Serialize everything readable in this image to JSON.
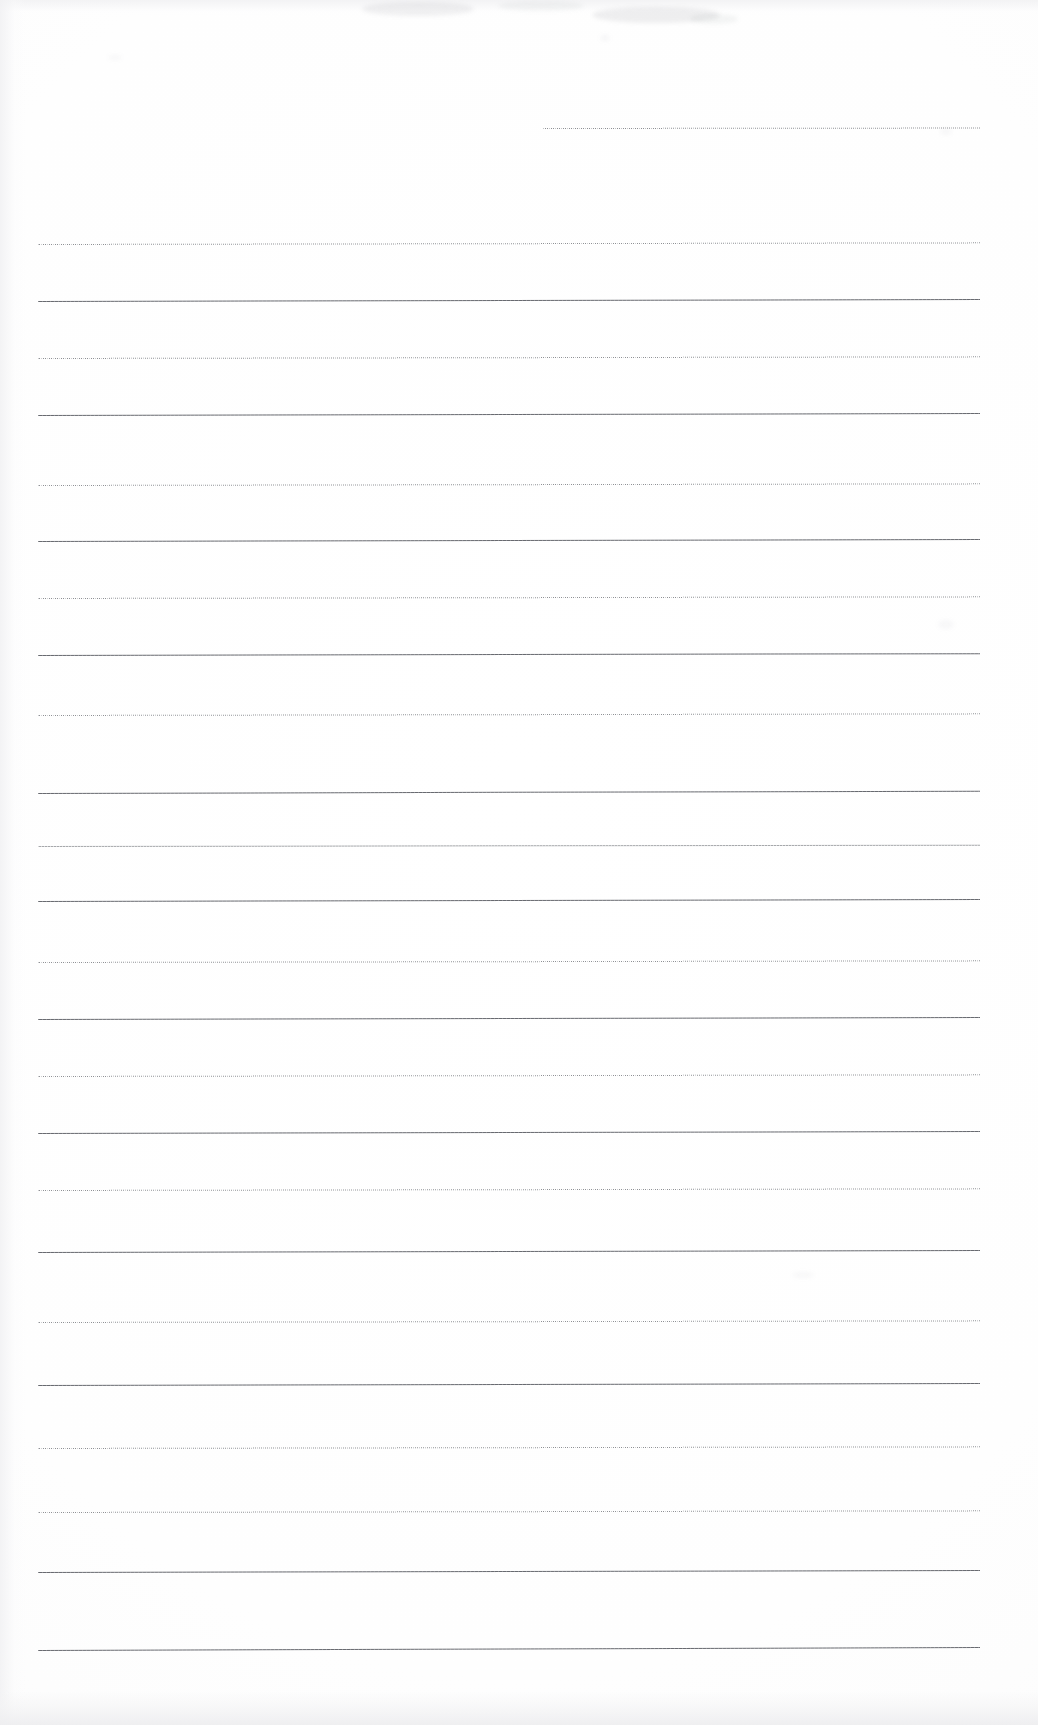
{
  "document": {
    "kind": "scanned-ruled-paper",
    "title": "Blank ruled notebook page (scan)",
    "written_content": "",
    "page_width": 1038,
    "page_height": 1725,
    "paper_color": "#ffffff",
    "rule_color": "#5a5c62",
    "rule_left_margin": 38,
    "rule_right_margin": 980,
    "rule_count_full_width": 25,
    "rule_count_partial": 1,
    "text_blocks": [],
    "annotations": []
  },
  "rules": [
    {
      "name": "rule-partial-header",
      "x": 543,
      "y": 128,
      "width": 437,
      "tilt": -0.06,
      "weight": "soft",
      "partial": true
    },
    {
      "name": "rule-1",
      "x": 38,
      "y": 244,
      "width": 942,
      "tilt": -0.1,
      "weight": "soft"
    },
    {
      "name": "rule-2",
      "x": 38,
      "y": 301,
      "width": 942,
      "tilt": -0.12,
      "weight": "dense"
    },
    {
      "name": "rule-3",
      "x": 38,
      "y": 358,
      "width": 942,
      "tilt": -0.1,
      "weight": "soft"
    },
    {
      "name": "rule-4",
      "x": 38,
      "y": 415,
      "width": 942,
      "tilt": -0.12,
      "weight": "dense"
    },
    {
      "name": "rule-5",
      "x": 38,
      "y": 485,
      "width": 942,
      "tilt": -0.1,
      "weight": "soft"
    },
    {
      "name": "rule-6",
      "x": 38,
      "y": 541,
      "width": 942,
      "tilt": -0.12,
      "weight": "dense"
    },
    {
      "name": "rule-7",
      "x": 38,
      "y": 598,
      "width": 942,
      "tilt": -0.1,
      "weight": "soft"
    },
    {
      "name": "rule-8",
      "x": 38,
      "y": 655,
      "width": 942,
      "tilt": -0.11,
      "weight": "dense"
    },
    {
      "name": "rule-9",
      "x": 38,
      "y": 715,
      "width": 942,
      "tilt": -0.1,
      "weight": "soft"
    },
    {
      "name": "rule-10",
      "x": 38,
      "y": 793,
      "width": 942,
      "tilt": -0.14,
      "weight": "dense"
    },
    {
      "name": "rule-11",
      "x": 38,
      "y": 846,
      "width": 942,
      "tilt": -0.08,
      "weight": "light"
    },
    {
      "name": "rule-12",
      "x": 38,
      "y": 901,
      "width": 942,
      "tilt": -0.12,
      "weight": "dense"
    },
    {
      "name": "rule-13",
      "x": 38,
      "y": 962,
      "width": 942,
      "tilt": -0.1,
      "weight": "soft"
    },
    {
      "name": "rule-14",
      "x": 38,
      "y": 1019,
      "width": 942,
      "tilt": -0.12,
      "weight": "dense"
    },
    {
      "name": "rule-15",
      "x": 38,
      "y": 1076,
      "width": 942,
      "tilt": -0.1,
      "weight": "soft"
    },
    {
      "name": "rule-16",
      "x": 38,
      "y": 1133,
      "width": 942,
      "tilt": -0.12,
      "weight": "dense"
    },
    {
      "name": "rule-17",
      "x": 38,
      "y": 1190,
      "width": 942,
      "tilt": -0.1,
      "weight": "soft"
    },
    {
      "name": "rule-18",
      "x": 38,
      "y": 1252,
      "width": 942,
      "tilt": -0.12,
      "weight": "dense"
    },
    {
      "name": "rule-19",
      "x": 38,
      "y": 1322,
      "width": 942,
      "tilt": -0.1,
      "weight": "soft"
    },
    {
      "name": "rule-20",
      "x": 38,
      "y": 1385,
      "width": 942,
      "tilt": -0.12,
      "weight": "dense"
    },
    {
      "name": "rule-21",
      "x": 38,
      "y": 1448,
      "width": 942,
      "tilt": -0.1,
      "weight": "soft"
    },
    {
      "name": "rule-22",
      "x": 38,
      "y": 1512,
      "width": 942,
      "tilt": -0.1,
      "weight": "soft"
    },
    {
      "name": "rule-23",
      "x": 38,
      "y": 1572,
      "width": 942,
      "tilt": -0.12,
      "weight": "dense"
    },
    {
      "name": "rule-24",
      "x": 38,
      "y": 1650,
      "width": 942,
      "tilt": -0.18,
      "weight": "dense"
    }
  ],
  "artifacts": [
    {
      "name": "scan-smudge-top-left",
      "x": 362,
      "y": 2,
      "width": 112,
      "height": 14,
      "opacity": 0.1
    },
    {
      "name": "scan-smudge-top-center",
      "x": 498,
      "y": 1,
      "width": 86,
      "height": 10,
      "opacity": 0.07
    },
    {
      "name": "scan-smudge-top-right",
      "x": 592,
      "y": 7,
      "width": 128,
      "height": 16,
      "opacity": 0.12
    },
    {
      "name": "scan-smudge-top-far",
      "x": 690,
      "y": 14,
      "width": 48,
      "height": 10,
      "opacity": 0.08
    },
    {
      "name": "scan-speck-upper",
      "x": 600,
      "y": 35,
      "width": 10,
      "height": 6,
      "opacity": 0.06
    },
    {
      "name": "scan-speck-left",
      "x": 108,
      "y": 55,
      "width": 14,
      "height": 5,
      "opacity": 0.05
    },
    {
      "name": "scan-speck-right",
      "x": 940,
      "y": 128,
      "width": 12,
      "height": 7,
      "opacity": 0.05
    },
    {
      "name": "scan-speck-mid-right",
      "x": 938,
      "y": 620,
      "width": 16,
      "height": 9,
      "opacity": 0.05
    },
    {
      "name": "scan-speck-low-right",
      "x": 792,
      "y": 1272,
      "width": 22,
      "height": 6,
      "opacity": 0.05
    }
  ]
}
